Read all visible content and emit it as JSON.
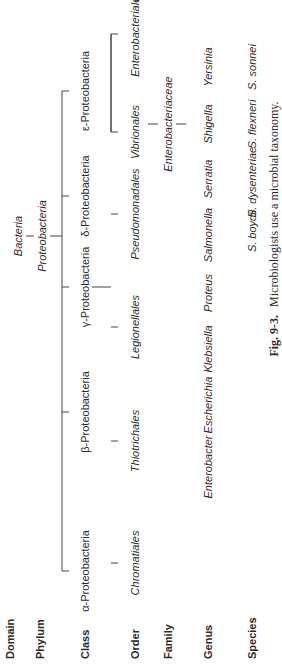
{
  "figure": {
    "title": "Fig. 9-3.",
    "caption": "Microbiologists use a microbial taxonomy.",
    "orientation": "rotated 90° counter-clockwise"
  },
  "ranks": [
    "Domain",
    "Phylum",
    "Class",
    "Order",
    "Family",
    "Genus",
    "Species"
  ],
  "tree": {
    "domain": "Bacteria",
    "phylum": "Proteobacteria",
    "classes": [
      "α-Proteobacteria",
      "β-Proteobacteria",
      "γ-Proteobacteria",
      "δ-Proteobacteria",
      "ε-Proteobacteria"
    ],
    "orders": [
      "Chromatiales",
      "Thiotrichales",
      "Legionellales",
      "Pseudomonadales",
      "Vibrionales",
      "Enterobacteriales",
      "Pasteurellales"
    ],
    "family": "Enterobacteriaceae",
    "genera": [
      "Enterobacter",
      "Escherichia",
      "Klebsiella",
      "Proteus",
      "Salmonella",
      "Serratia",
      "Shigella",
      "Yersinia"
    ],
    "species": [
      "S. boydii",
      "S. dysenteriae",
      "S. flexneri",
      "S. sonnei"
    ]
  }
}
